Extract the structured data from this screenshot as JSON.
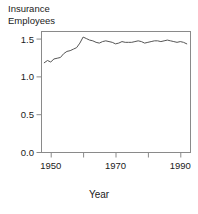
{
  "chart_data": {
    "type": "line",
    "title": "Insurance Employees",
    "title_lines": [
      "Insurance",
      "Employees"
    ],
    "xlabel": "Year",
    "ylabel": "",
    "grid": false,
    "legend": "none",
    "xlim": [
      1947,
      1993
    ],
    "ylim": [
      0.0,
      1.6
    ],
    "xticks": [
      1950,
      1960,
      1970,
      1980,
      1990
    ],
    "xtick_labels": [
      "1950",
      "",
      "1970",
      "",
      "1990"
    ],
    "yticks": [
      0.0,
      0.5,
      1.0,
      1.5
    ],
    "ytick_labels": [
      "0.0",
      "0.5",
      "1.0",
      "1.5"
    ],
    "line_color": "#555555",
    "frame_color": "#8a8a8a",
    "series": [
      {
        "name": "Insurance Employees",
        "x": [
          1948,
          1949,
          1950,
          1951,
          1952,
          1953,
          1954,
          1955,
          1956,
          1957,
          1958,
          1959,
          1960,
          1961,
          1962,
          1963,
          1964,
          1965,
          1966,
          1967,
          1968,
          1969,
          1970,
          1971,
          1972,
          1973,
          1974,
          1975,
          1976,
          1977,
          1978,
          1979,
          1980,
          1981,
          1982,
          1983,
          1984,
          1985,
          1986,
          1987,
          1988,
          1989,
          1990,
          1991,
          1992
        ],
        "values": [
          1.18,
          1.21,
          1.19,
          1.23,
          1.24,
          1.25,
          1.3,
          1.33,
          1.34,
          1.36,
          1.38,
          1.44,
          1.52,
          1.5,
          1.48,
          1.47,
          1.45,
          1.44,
          1.46,
          1.47,
          1.46,
          1.45,
          1.43,
          1.44,
          1.46,
          1.45,
          1.45,
          1.45,
          1.46,
          1.47,
          1.46,
          1.44,
          1.45,
          1.46,
          1.47,
          1.47,
          1.46,
          1.47,
          1.48,
          1.47,
          1.46,
          1.45,
          1.46,
          1.45,
          1.43
        ]
      }
    ]
  },
  "plot_geometry": {
    "left": 41,
    "right": 190,
    "top": 31,
    "bottom": 152
  }
}
